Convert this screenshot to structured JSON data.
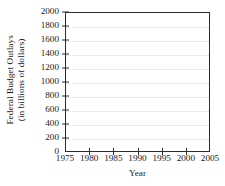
{
  "chart_data": {
    "type": "line",
    "title": "",
    "subtitle": "",
    "xlabel": "Year",
    "ylabel_line1": "Federal Budget Outlays",
    "ylabel_line2": "(in billions of dollars)",
    "ylabel": "Federal Budget Outlays (in billions of dollars)",
    "xlim": [
      1975,
      2005
    ],
    "ylim": [
      0,
      2000
    ],
    "xticks": [
      1975,
      1980,
      1985,
      1990,
      1995,
      2000,
      2005
    ],
    "xticklabels": [
      "1975",
      "1980",
      "1985",
      "1990",
      "1995",
      "2000",
      "2005"
    ],
    "yticks": [
      0,
      200,
      400,
      600,
      800,
      1000,
      1200,
      1400,
      1600,
      1800,
      2000
    ],
    "yticklabels": [
      "0",
      "200",
      "400",
      "600",
      "800",
      "1000",
      "1200",
      "1400",
      "1600",
      "1800",
      "2000"
    ],
    "x": [],
    "values": [],
    "series": [],
    "legend": [],
    "legend_position": "none",
    "grid": true,
    "grid_axis": "y",
    "grid_style": "dotted",
    "annotations": []
  },
  "style": {
    "background": "#ffffff",
    "axis_color": "#2b2b2b",
    "grid_color": "#d9d9d9",
    "text_color": "#1a1a1a"
  }
}
